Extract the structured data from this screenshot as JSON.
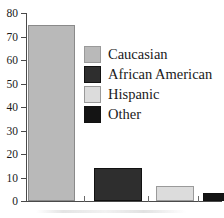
{
  "chart_data": {
    "type": "bar",
    "title": "",
    "xlabel": "",
    "ylabel": "",
    "categories": [
      "Caucasian",
      "African American",
      "Hispanic",
      "Other"
    ],
    "values": [
      75,
      14,
      6.5,
      3.5
    ],
    "ylim": [
      0,
      80
    ],
    "yticks": [
      0,
      10,
      20,
      30,
      40,
      50,
      60,
      70,
      80
    ],
    "ytick_labels": [
      "0",
      "10",
      "20",
      "30",
      "40",
      "50",
      "60",
      "70",
      "80"
    ],
    "xtick_labels": [
      "",
      "",
      "",
      ""
    ],
    "grid": false,
    "legend_position": "inside-upper-right",
    "series": [
      {
        "name": "Caucasian",
        "value": 75,
        "color": "#b9b9b9"
      },
      {
        "name": "African American",
        "value": 14,
        "color": "#2e2e2e"
      },
      {
        "name": "Hispanic",
        "value": 6.5,
        "color": "#dcdcdc"
      },
      {
        "name": "Other",
        "value": 3.5,
        "color": "#141414"
      }
    ]
  },
  "legend": {
    "items": [
      {
        "label": "Caucasian",
        "color": "#b9b9b9"
      },
      {
        "label": "African American",
        "color": "#2e2e2e"
      },
      {
        "label": "Hispanic",
        "color": "#dcdcdc"
      },
      {
        "label": "Other",
        "color": "#141414"
      }
    ]
  },
  "axes": {
    "y": {
      "ticks": [
        {
          "label": "80",
          "value": 80
        },
        {
          "label": "70",
          "value": 70
        },
        {
          "label": "60",
          "value": 60
        },
        {
          "label": "50",
          "value": 50
        },
        {
          "label": "40",
          "value": 40
        },
        {
          "label": "30",
          "value": 30
        },
        {
          "label": "20",
          "value": 20
        },
        {
          "label": "10",
          "value": 10
        },
        {
          "label": "0",
          "value": 0
        }
      ]
    }
  },
  "colors": {
    "axis": "#4a4a4a",
    "text": "#1a1a1a",
    "background": "#ffffff",
    "bar_caucasian": "#b9b9b9",
    "bar_african_american": "#2e2e2e",
    "bar_hispanic": "#dcdcdc",
    "bar_other": "#141414"
  }
}
